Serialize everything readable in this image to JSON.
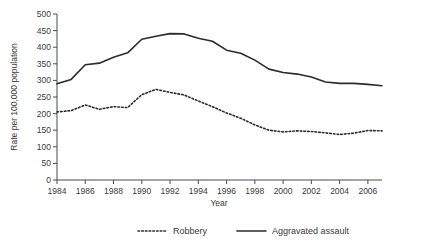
{
  "chart_data": {
    "type": "line",
    "title": "",
    "xlabel": "Year",
    "ylabel": "Rate per 100,000 population",
    "xlim": [
      1984,
      2007
    ],
    "ylim": [
      0,
      500
    ],
    "grid": false,
    "legend_position": "bottom",
    "x": [
      1984,
      1985,
      1986,
      1987,
      1988,
      1989,
      1990,
      1991,
      1992,
      1993,
      1994,
      1995,
      1996,
      1997,
      1998,
      1999,
      2000,
      2001,
      2002,
      2003,
      2004,
      2005,
      2006,
      2007
    ],
    "xticks": [
      1984,
      1986,
      1988,
      1990,
      1992,
      1994,
      1996,
      1998,
      2000,
      2002,
      2004,
      2006
    ],
    "xtick_labels": [
      "1984",
      "1986",
      "1988",
      "1990",
      "1992",
      "1994",
      "1996",
      "1998",
      "2000",
      "2002",
      "2004",
      "2006"
    ],
    "yticks": [
      0,
      50,
      100,
      150,
      200,
      250,
      300,
      350,
      400,
      450,
      500
    ],
    "ytick_labels": [
      "0",
      "50",
      "100",
      "150",
      "200",
      "250",
      "300",
      "350",
      "400",
      "450",
      "500"
    ],
    "series": [
      {
        "name": "Robbery",
        "style": "dashed",
        "color": "#2b2b2b",
        "values": [
          205,
          209,
          226,
          213,
          221,
          218,
          257,
          273,
          264,
          256,
          238,
          221,
          202,
          186,
          166,
          150,
          145,
          148,
          146,
          142,
          137,
          141,
          149,
          148
        ]
      },
      {
        "name": "Aggravated assault",
        "style": "solid",
        "color": "#2b2b2b",
        "values": [
          290,
          303,
          347,
          352,
          370,
          383,
          424,
          433,
          441,
          440,
          427,
          418,
          391,
          382,
          361,
          334,
          324,
          319,
          310,
          295,
          291,
          291,
          288,
          284
        ]
      }
    ]
  },
  "legend": {
    "items": [
      {
        "label": "Robbery",
        "style": "dashed"
      },
      {
        "label": "Aggravated assault",
        "style": "solid"
      }
    ]
  }
}
